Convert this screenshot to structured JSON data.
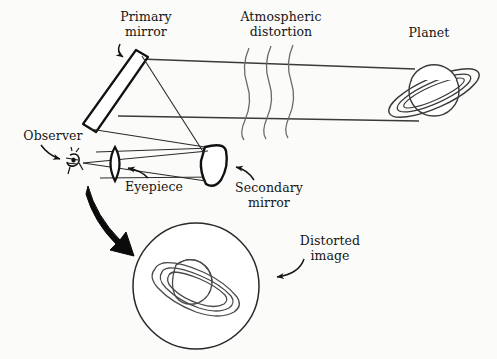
{
  "figure": {
    "background_color": "#fbfbf9",
    "ink_color": "#151515",
    "width": 497,
    "height": 359
  },
  "labels": {
    "primary_mirror": "Primary\nmirror",
    "atmospheric_distortion": "Atmospheric\ndistortion",
    "planet": "Planet",
    "observer": "Observer",
    "eyepiece": "Eyepiece",
    "secondary_mirror": "Secondary\nmirror",
    "distorted_image": "Distorted\nimage"
  },
  "diagram": {
    "ray_paths": [
      "upper ray from planet to primary mirror top",
      "lower ray from planet to primary mirror bottom",
      "reflected rays from primary mirror to secondary mirror",
      "reflected rays from secondary mirror to eyepiece",
      "rays converging at observer eye"
    ],
    "atmosphere_wave_count": 3,
    "planet_type": "ringed-planet",
    "inset_view": "distorted ringed planet in circular field of view"
  }
}
